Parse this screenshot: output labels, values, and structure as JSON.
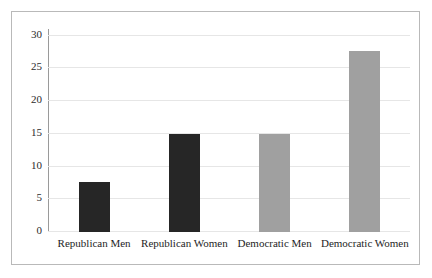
{
  "chart_data": {
    "type": "bar",
    "title": "",
    "subtitle": "",
    "xlabel": "",
    "ylabel": "",
    "categories": [
      "Republican Men",
      "Republican Women",
      "Democratic Men",
      "Democratic Women"
    ],
    "values": [
      7.6,
      15.0,
      15.0,
      27.7
    ],
    "series": [
      {
        "name": "",
        "values": [
          7.6,
          15.0,
          15.0,
          27.7
        ]
      }
    ],
    "bar_colors": [
      "#262626",
      "#262626",
      "#a0a0a0",
      "#a0a0a0"
    ],
    "ylim": [
      0,
      31
    ],
    "yticks": [
      0,
      5,
      10,
      15,
      20,
      25,
      30
    ],
    "ytick_labels": [
      "0",
      "5",
      "10",
      "15",
      "20",
      "25",
      "30"
    ],
    "grid": true,
    "grid_axis": "y",
    "legend": false,
    "legend_position": "none",
    "annotations": []
  },
  "style": {
    "frame_border_color": "#b9b9b9",
    "background_color": "#ffffff",
    "gridline_color": "#e6e6e6",
    "axis_line_color": "#9a9a9a",
    "tick_text_color": "#2b2b2b",
    "category_text_color": "#1e1e1e",
    "dark_bar_color": "#262626",
    "light_bar_color": "#a0a0a0"
  }
}
